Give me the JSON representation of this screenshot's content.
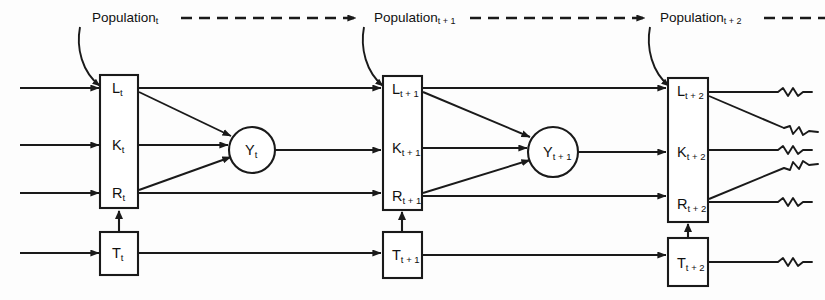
{
  "diagram": {
    "colors": {
      "stroke": "#1a1a1a",
      "background": "#fdfdfd",
      "fill": "#ffffff"
    },
    "periods": [
      {
        "id": "t",
        "population_label": "Population",
        "population_subscript": "t",
        "stock_box": {
          "rows": [
            {
              "label": "L",
              "subscript": "t",
              "name": "labor"
            },
            {
              "label": "K",
              "subscript": "t",
              "name": "capital"
            },
            {
              "label": "R",
              "subscript": "t",
              "name": "resources"
            }
          ]
        },
        "tech_box": {
          "label": "T",
          "subscript": "t",
          "name": "technology"
        },
        "output_node": {
          "label": "Y",
          "subscript": "t",
          "name": "output"
        },
        "has_output_circle": true,
        "terminator": "arrow"
      },
      {
        "id": "t+1",
        "population_label": "Population",
        "population_subscript": "t + 1",
        "stock_box": {
          "rows": [
            {
              "label": "L",
              "subscript": "t + 1",
              "name": "labor"
            },
            {
              "label": "K",
              "subscript": "t + 1",
              "name": "capital"
            },
            {
              "label": "R",
              "subscript": "t + 1",
              "name": "resources"
            }
          ]
        },
        "tech_box": {
          "label": "T",
          "subscript": "t + 1",
          "name": "technology"
        },
        "output_node": {
          "label": "Y",
          "subscript": "t + 1",
          "name": "output"
        },
        "has_output_circle": true,
        "terminator": "arrow"
      },
      {
        "id": "t+2",
        "population_label": "Population",
        "population_subscript": "t + 2",
        "stock_box": {
          "rows": [
            {
              "label": "L",
              "subscript": "t + 2",
              "name": "labor"
            },
            {
              "label": "K",
              "subscript": "t + 2",
              "name": "capital"
            },
            {
              "label": "R",
              "subscript": "t + 2",
              "name": "resources"
            }
          ]
        },
        "tech_box": {
          "label": "T",
          "subscript": "t + 2",
          "name": "technology"
        },
        "output_node": null,
        "has_output_circle": false,
        "terminator": "squiggle-break"
      }
    ],
    "connector_notes": {
      "population_pointer": "curved-arrow-to-stock-box",
      "period_link": "dashed-arrow-right",
      "tech_to_stock": "vertical-arrow-up",
      "inputs": "four-horizontal-arrows-from-left-edge"
    }
  }
}
